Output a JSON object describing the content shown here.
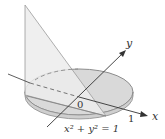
{
  "diagram": {
    "type": "3d-solid-cone-over-unit-disk",
    "labels": {
      "y_axis": "y",
      "x_axis": "x",
      "origin": "0",
      "tick_one": "1",
      "equation": "x² + y² = 1"
    },
    "colors": {
      "disk_fill": "#d9d9d9",
      "disk_front_fill": "#cfcfcf",
      "solid_fill": "#ececec",
      "outline": "#8c8c8c",
      "axis": "#333333"
    }
  }
}
